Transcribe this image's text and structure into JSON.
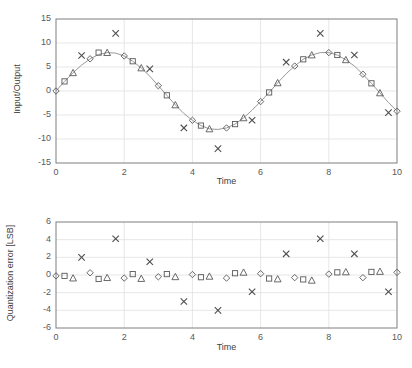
{
  "figure": {
    "title": "",
    "panels": [
      "input-output-panel",
      "quantization-error-panel"
    ]
  },
  "top_panel": {
    "ylabel": "Input/Output",
    "xlabel": "Time",
    "yticks": [
      "-15",
      "-10",
      "-5",
      "0",
      "5",
      "10",
      "15"
    ],
    "xticks": [
      "0",
      "2",
      "4",
      "6",
      "8",
      "10"
    ]
  },
  "bottom_panel": {
    "ylabel": "Quantization error [LSB]",
    "xlabel": "Time",
    "yticks": [
      "-6",
      "-4",
      "-2",
      "0",
      "2",
      "4",
      "6"
    ],
    "xticks": [
      "0",
      "2",
      "4",
      "6",
      "8",
      "10"
    ]
  },
  "colors": {
    "grid": "#e0e0e0",
    "frame": "#7f7f7f",
    "curve": "#8c8c8c",
    "marker": "#595959",
    "text": "#404040"
  },
  "chart_data": [
    {
      "type": "scatter",
      "name": "input-output-panel",
      "title": "",
      "xlabel": "Time",
      "ylabel": "Input/Output",
      "xlim": [
        0,
        10
      ],
      "ylim": [
        -15,
        15
      ],
      "xticks": [
        0,
        2,
        4,
        6,
        8,
        10
      ],
      "yticks": [
        -15,
        -10,
        -5,
        0,
        5,
        10,
        15
      ],
      "grid": true,
      "legend": "none",
      "line": {
        "name": "Input (sine)",
        "x": [
          0,
          0.25,
          0.5,
          0.75,
          1,
          1.25,
          1.5,
          1.75,
          2,
          2.25,
          2.5,
          2.75,
          3,
          3.25,
          3.5,
          3.75,
          4,
          4.25,
          4.5,
          4.75,
          5,
          5.25,
          5.5,
          5.75,
          6,
          6.25,
          6.5,
          6.75,
          7,
          7.25,
          7.5,
          7.75,
          8,
          8.25,
          8.5,
          8.75,
          9,
          9.25,
          9.5,
          9.75,
          10
        ],
        "y": [
          0,
          2,
          3.8,
          5.4,
          6.7,
          7.6,
          8,
          7.9,
          7.3,
          6.2,
          4.8,
          3.1,
          1.1,
          -0.9,
          -2.9,
          -4.7,
          -6.1,
          -7.2,
          -7.9,
          -8,
          -7.7,
          -6.9,
          -5.6,
          -4,
          -2.2,
          -0.3,
          1.7,
          3.6,
          5.2,
          6.6,
          7.5,
          8,
          8,
          7.5,
          6.5,
          5.2,
          3.5,
          1.6,
          -0.4,
          -2.4,
          -4.2
        ]
      },
      "series": [
        {
          "name": "Ideal sample (diamond)",
          "marker": "diamond",
          "x": [
            0,
            1,
            2,
            3,
            4,
            5,
            6,
            7,
            8,
            9,
            10
          ],
          "y": [
            0,
            6.7,
            7.3,
            1.1,
            -6.1,
            -7.7,
            -2.2,
            5.2,
            8,
            3.5,
            -4.2
          ]
        },
        {
          "name": "Quantized A (square)",
          "marker": "square",
          "x": [
            0.25,
            1.25,
            2.25,
            3.25,
            4.25,
            5.25,
            6.25,
            7.25,
            8.25,
            9.25
          ],
          "y": [
            2,
            8,
            6.2,
            -0.9,
            -7.2,
            -6.9,
            -0.3,
            6.6,
            7.5,
            1.6
          ]
        },
        {
          "name": "Quantized B (triangle)",
          "marker": "triangle",
          "x": [
            0.5,
            1.5,
            2.5,
            3.5,
            4.5,
            5.5,
            6.5,
            7.5,
            8.5,
            9.5
          ],
          "y": [
            3.8,
            8,
            4.8,
            -2.9,
            -7.9,
            -5.6,
            1.7,
            7.5,
            6.5,
            -0.4
          ]
        },
        {
          "name": "Quantized C (cross)",
          "marker": "cross",
          "x": [
            0.75,
            1.75,
            2.75,
            3.75,
            4.75,
            5.75,
            6.75,
            7.75,
            8.75,
            9.75
          ],
          "y": [
            7.4,
            12,
            4.6,
            -7.7,
            -12,
            -6.1,
            6,
            12,
            7.5,
            -4.5
          ]
        }
      ]
    },
    {
      "type": "scatter",
      "name": "quantization-error-panel",
      "title": "",
      "xlabel": "Time",
      "ylabel": "Quantization error [LSB]",
      "xlim": [
        0,
        10
      ],
      "ylim": [
        -6,
        6
      ],
      "xticks": [
        0,
        2,
        4,
        6,
        8,
        10
      ],
      "yticks": [
        -6,
        -4,
        -2,
        0,
        2,
        4,
        6
      ],
      "grid": true,
      "legend": "none",
      "series": [
        {
          "name": "Error diamond",
          "marker": "diamond",
          "x": [
            0,
            1,
            2,
            3,
            4,
            5,
            6,
            7,
            8,
            9,
            10
          ],
          "y": [
            -0.1,
            0.25,
            -0.35,
            -0.2,
            0.05,
            -0.35,
            0.15,
            -0.3,
            0.1,
            -0.3,
            0.3
          ]
        },
        {
          "name": "Error square",
          "marker": "square",
          "x": [
            0.25,
            1.25,
            2.25,
            3.25,
            4.25,
            5.25,
            6.25,
            7.25,
            8.25,
            9.25
          ],
          "y": [
            -0.1,
            -0.45,
            0.1,
            0.1,
            -0.25,
            0.2,
            -0.4,
            -0.5,
            0.3,
            0.35
          ]
        },
        {
          "name": "Error triangle",
          "marker": "triangle",
          "x": [
            0.5,
            1.5,
            2.5,
            3.5,
            4.5,
            5.5,
            6.5,
            7.5,
            8.5,
            9.5
          ],
          "y": [
            -0.35,
            -0.3,
            -0.4,
            -0.2,
            -0.15,
            0.3,
            -0.45,
            -0.6,
            0.35,
            0.4
          ]
        },
        {
          "name": "Error cross",
          "marker": "cross",
          "x": [
            0.75,
            1.75,
            2.75,
            3.75,
            4.75,
            5.75,
            6.75,
            7.75,
            8.75,
            9.75
          ],
          "y": [
            2.0,
            4.1,
            1.5,
            -3.0,
            -4.0,
            -1.9,
            2.4,
            4.1,
            2.4,
            -1.9
          ]
        }
      ]
    }
  ]
}
